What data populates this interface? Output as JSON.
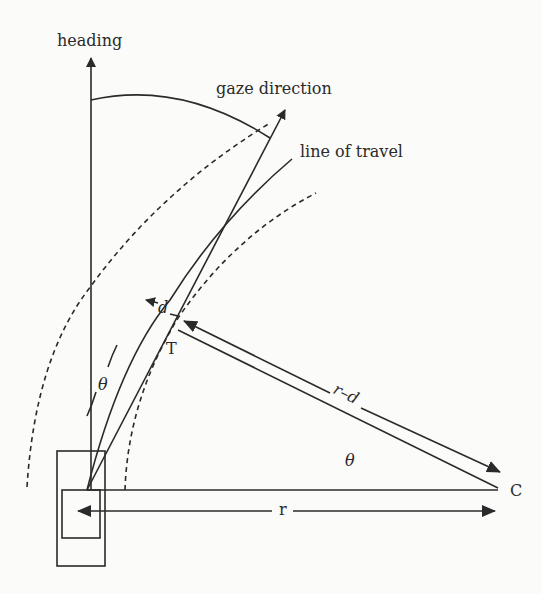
{
  "diagram": {
    "type": "geometry",
    "labels": {
      "heading": "heading",
      "gaze_direction": "gaze direction",
      "line_of_travel": "line of travel",
      "d": "d",
      "T": "T",
      "r_minus_d": "r–d",
      "theta_near": "θ",
      "theta_center": "θ",
      "C": "C",
      "r": "r"
    },
    "elements": [
      {
        "id": "heading-arrow",
        "kind": "arrow",
        "label": "heading"
      },
      {
        "id": "gaze-direction-arrow",
        "kind": "arrow",
        "label": "gaze direction"
      },
      {
        "id": "line-of-travel",
        "kind": "curve",
        "label": "line of travel"
      },
      {
        "id": "lane-edge-left",
        "kind": "dashed-curve"
      },
      {
        "id": "lane-edge-right",
        "kind": "dashed-curve"
      },
      {
        "id": "tangent-point",
        "kind": "point",
        "label": "T"
      },
      {
        "id": "center-point",
        "kind": "point",
        "label": "C"
      },
      {
        "id": "radius-r",
        "kind": "double-arrow",
        "label": "r"
      },
      {
        "id": "radius-r-minus-d",
        "kind": "double-arrow",
        "label": "r–d"
      },
      {
        "id": "offset-d",
        "kind": "double-arrow",
        "label": "d"
      },
      {
        "id": "vehicle",
        "kind": "rectangle"
      },
      {
        "id": "driver-position",
        "kind": "rectangle"
      }
    ],
    "colors": {
      "stroke": "#2a2a2a",
      "background": "#fbfbfa"
    }
  }
}
